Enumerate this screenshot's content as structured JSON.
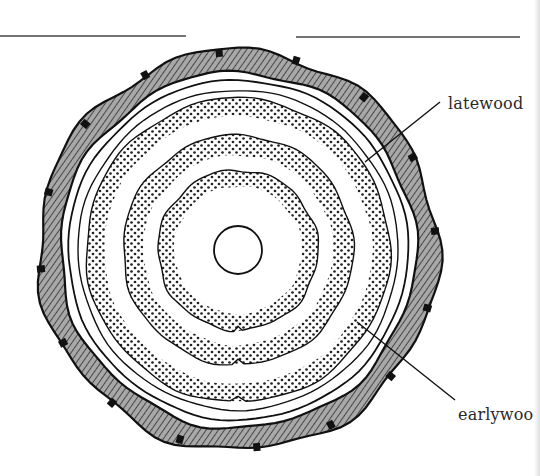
{
  "figure": {
    "center": [
      238,
      250
    ],
    "pith_radius": 24,
    "bark": {
      "inner_radius": 178,
      "outer_radius": 200,
      "fill": "#9a9a9a",
      "stroke": "#111111"
    },
    "cambium_ring_radius": 160,
    "sapwood_line_radius": 170,
    "growth_rings": [
      {
        "name": "ring-1",
        "earlywood_inner": 24,
        "latewood_inner": 64,
        "latewood_outer": 80
      },
      {
        "name": "ring-2",
        "earlywood_inner": 80,
        "latewood_inner": 95,
        "latewood_outer": 115
      },
      {
        "name": "ring-3",
        "earlywood_inner": 115,
        "latewood_inner": 134,
        "latewood_outer": 152
      }
    ],
    "colors": {
      "ink": "#1a1a1a",
      "dots": "#222222",
      "background": "#ffffff"
    }
  },
  "labels": {
    "latewood": "latewood",
    "earlywood": "earlywoo"
  },
  "leader_lines": {
    "latewood": {
      "x1": 440,
      "y1": 102,
      "x2": 365,
      "y2": 162
    },
    "earlywood": {
      "x1": 455,
      "y1": 400,
      "x2": 357,
      "y2": 322
    }
  },
  "top_rules": [
    {
      "x1": 0,
      "y1": 36,
      "x2": 186,
      "y2": 36
    },
    {
      "x1": 296,
      "y1": 37,
      "x2": 520,
      "y2": 37
    }
  ]
}
